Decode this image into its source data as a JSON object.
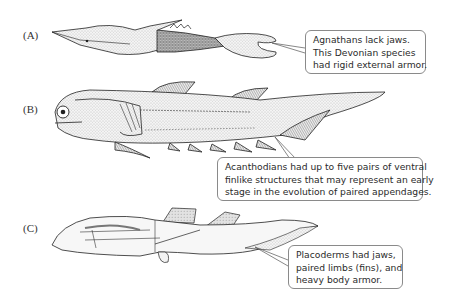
{
  "panels": [
    {
      "label": "(A)",
      "organism": "agnathan",
      "callout": {
        "lines": [
          "Agnathans lack jaws.",
          "This Devonian species",
          "had rigid external armor."
        ]
      }
    },
    {
      "label": "(B)",
      "organism": "acanthodian",
      "callout": {
        "lines": [
          "Acanthodians had up to five pairs of ventral",
          "finlike structures that may represent an early",
          "stage in the evolution of paired appendages."
        ]
      }
    },
    {
      "label": "(C)",
      "organism": "placoderm",
      "callout": {
        "lines": [
          "Placoderms had jaws,",
          "paired limbs (fins), and",
          "heavy body armor."
        ]
      }
    }
  ],
  "colors": {
    "line": "#222222",
    "stipple": "#9a9a9a",
    "callout_border": "#8a8a8a",
    "background": "#ffffff"
  }
}
